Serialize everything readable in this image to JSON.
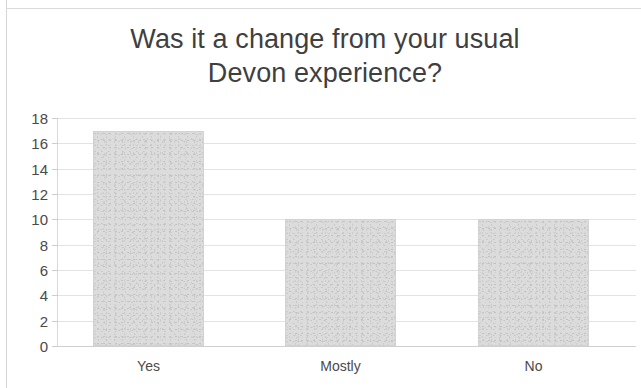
{
  "chart_data": {
    "type": "bar",
    "title": "Was it a change from your usual\nDevon experience?",
    "title_line_1": "Was it a change from your usual",
    "title_line_2": "Devon experience?",
    "categories": [
      "Yes",
      "Mostly",
      "No"
    ],
    "values": [
      17,
      10,
      10
    ],
    "xlabel": "",
    "ylabel": "",
    "ylim": [
      0,
      18
    ],
    "ytick_step": 2,
    "yticks": [
      "18",
      "16",
      "14",
      "12",
      "10",
      "8",
      "6",
      "4",
      "2",
      "0"
    ],
    "ytick_values": [
      18,
      16,
      14,
      12,
      10,
      8,
      6,
      4,
      2,
      0
    ],
    "grid": true,
    "legend": false,
    "legend_position": "none",
    "series": [
      {
        "name": "Responses",
        "values": [
          17,
          10,
          10
        ]
      }
    ],
    "colors": {
      "bar_fill": "#dcdcdc",
      "bar_border": "#d2d2d2",
      "gridline": "#e3e3e3",
      "axis": "#d9d9d9",
      "title_text": "#3f3f3f",
      "tick_text": "#4a4a4a",
      "background": "#ffffff"
    }
  }
}
